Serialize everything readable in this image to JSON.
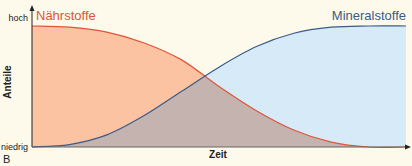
{
  "chart_data": {
    "type": "area",
    "title": "",
    "xlabel": "Zeit",
    "ylabel": "Anteile",
    "y_tick_labels": [
      "hoch",
      "niedrig"
    ],
    "panel_label": "B",
    "xlim": [
      0,
      1
    ],
    "ylim": [
      0,
      1
    ],
    "grid": false,
    "series": [
      {
        "name": "Nährstoffe",
        "color": "#e2533a",
        "fill": "#fbc3a2",
        "x": [
          0,
          0.1,
          0.2,
          0.3,
          0.4,
          0.5,
          0.6,
          0.7,
          0.8,
          0.9,
          1.0
        ],
        "values": [
          1.0,
          0.99,
          0.95,
          0.86,
          0.72,
          0.5,
          0.3,
          0.14,
          0.04,
          0.0,
          0.0
        ]
      },
      {
        "name": "Mineralstoffe",
        "color": "#3a5a8a",
        "fill": "#d6ebf7",
        "x": [
          0,
          0.1,
          0.2,
          0.3,
          0.4,
          0.5,
          0.6,
          0.7,
          0.8,
          0.9,
          1.0
        ],
        "values": [
          0.0,
          0.02,
          0.1,
          0.26,
          0.46,
          0.66,
          0.83,
          0.94,
          0.99,
          1.0,
          1.0
        ]
      }
    ],
    "overlap_fill": "#c4b3af"
  }
}
